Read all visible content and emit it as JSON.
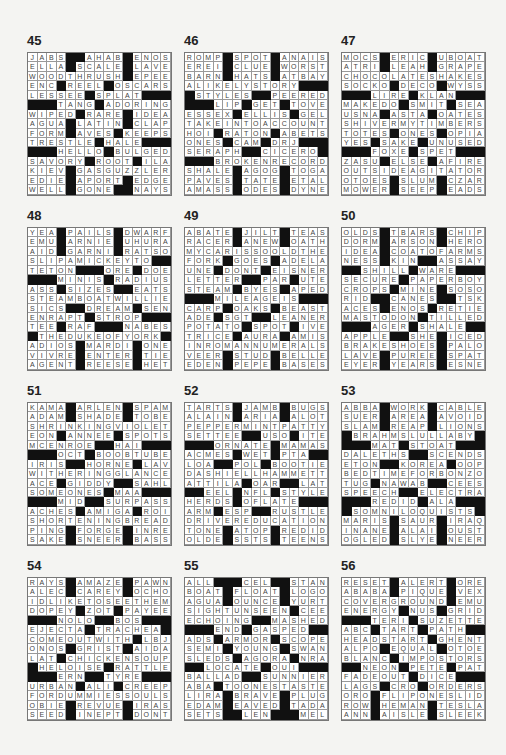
{
  "page": {
    "puzzles": [
      {
        "number": "45",
        "rows": [
          "JABS##AHAB#ENOS",
          "ELLA#SCALE#LAVE",
          "WOODTHRUSH#EPEE",
          "ENC#REEL#OSCARS",
          "LESSEE#SPLAT###",
          "###TANG#ADORING",
          "WIPED#RARE#IDEA",
          "AGUA#LATIN#CLAP",
          "FORM#AVES#KEEPS",
          "TRESTLE#HALE###",
          "###HELLO#BULGED",
          "SAVORY#ROOT#ILA",
          "KIEV#GASGUZZLER",
          "EDIE#APORT#EDGE",
          "WELL#GONE##NAYS"
        ]
      },
      {
        "number": "46",
        "rows": [
          "ROMP#SPOT#ANAIS",
          "EREI#CLUE#WORST",
          "BARN#HATS#ATBAY",
          "ALIKELYSTORY###",
          "#STYLES##PEERED",
          "###LIP#GET#TOVE",
          "ESSEX#ELLIS#GEL",
          "TAKEINTOACCOUNT",
          "HOI#RATON#ABETS",
          "ONES#CAM#DRJ###",
          "SERAPH##CICERO#",
          "###BROKENRECORD",
          "SHALE#AGOG#TOGA",
          "PAVES#TATE#ETAL",
          "AMASS#ODES#DYNE"
        ]
      },
      {
        "number": "47",
        "rows": [
          "MOCS#ERIC#UBOAT",
          "ATRI#LEAH#GRAPE",
          "CHOCOLATESHAKES",
          "SOCKO#DECO#WYSS",
          "###LIRE#KLAN###",
          "MAKEDO#SMIT#SEA",
          "USNA#ASTA#OATES",
          "SHIVERMYTIMBERS",
          "TOTES#ONES#OPIA",
          "YES#SAKE#UNUSED",
          "###FOXE#SPET###",
          "ZASU#ELSE#AFIRE",
          "OUTSIDEAGITATOR",
          "OTOES#SLUM#CZAR",
          "MOWER#SEEP#EADS"
        ]
      },
      {
        "number": "48",
        "rows": [
          "YEA#PAILS#DWARF",
          "EMU#ARNIE#UHURA",
          "AID#GARNI#RATSO",
          "SLIPAMICKEYTO##",
          "TETON###ORE#DOE",
          "###MINIS#RADIUS",
          "ASS#SIZES##EATS",
          "STEAMBOATWILLIE",
          "SICS##DREAM#SEN",
          "ENRAPT#STROP###",
          "TEE#RAF###NABES",
          "#THEDUKEOFYORK#",
          "ADIOS#MARDI#ONE",
          "VIVRE#ENTER#TIE",
          "AGENT#REESE#HET"
        ]
      },
      {
        "number": "49",
        "rows": [
          "ABATE#JILT#TEAS",
          "RACER#ANEW#OATH",
          "MYCARISSOOLDTHE",
          "FORK#GOES#ADELA",
          "UNE#DONT#EISNER",
          "LETTER##PAR#UTE",
          "STEAM#BYES#APED",
          "###MILEAGEIS###",
          "CARP#OAKS#BEAST",
          "ADE#SGT##LEANER",
          "POTATO#SPOT#IVE",
          "TRICE#AURA#AMIS",
          "INROMANNUMERALS",
          "VEER#STUD#BELLE",
          "EDEN#PEPE#BASES"
        ]
      },
      {
        "number": "50",
        "rows": [
          "OLDS#TBARS#CHIP",
          "DORM#ARSON#HERO",
          "IDEA#COATOFARMS",
          "NESS#KIN##ASSAY",
          "##SHILL#WARE###",
          "SECURE#PAPERBOY",
          "CROPS#MINE#SOSO",
          "RID##CANES##TSK",
          "ACES#ENOS#RETIE",
          "MASTODON#TILLED",
          "###AGER#SHALE##",
          "APPLE##SHE#ICED",
          "BRAKESHOES#PALO",
          "LAVE#PUREE#SPAT",
          "EYER#YEARS#ESNE"
        ]
      },
      {
        "number": "51",
        "rows": [
          "KAMA#ARLEN#SPAM",
          "ADAM#SHADE#TOBE",
          "SHRINKINGVIOLET",
          "EON#ANNEE#SPOTS",
          "MCENROE##HAI###",
          "###OCT#BOOBTUBE",
          "IRIS##HORNE#LAV",
          "WITHERINGGLANCE",
          "ACE#GIDDY##SAHL",
          "SOMEONES#MAA###",
          "###MID##SURPASS",
          "ACHES#AMIGA#ROI",
          "SHORTENINGBREAD",
          "PING#FORGE#INRE",
          "SAKE#SNEER#BASS"
        ]
      },
      {
        "number": "52",
        "rows": [
          "TARTS#JAMB#BUGS",
          "ALAIN#ARIA#ALOT",
          "PEPPERMINTPATTY",
          "SETTEE##USO#ITE",
          "###ORNATE#MAMAS",
          "ACMES#WET#PTA##",
          "LOA##POL#BOOTIE",
          "DASHIELLHAMMETT",
          "ATTILA#OAR##LAT",
          "##EEL#NFL#STYLE",
          "HERDS#OFLATE###",
          "ARM#ESP##RUSTLE",
          "DRIVEREDUCATION",
          "TONE#ATOP#REDID",
          "OLDE#SSTS#TEENS"
        ]
      },
      {
        "number": "53",
        "rows": [
          "ABBA#WORK#CABLE",
          "SUER#AREA#AVOID",
          "SLAM#REAP#LIONS",
          "#BRAHMSLULLABY#",
          "###MAT#STOAT###",
          "DALETHS##SCENDS",
          "ETON##KOREA#OOP",
          "BEDTIMEFORBONZO",
          "TUG#NAWAB##CEES",
          "SPEECH##ELECTRA",
          "###REDID#ALA###",
          "#SOMNILOQUISTS#",
          "MARIS#SAUR#IRAQ",
          "INANE#ALAI#OUST",
          "OGLED#SLYE#NEER"
        ]
      },
      {
        "number": "54",
        "rows": [
          "RAYS#AMAZE#PAWN",
          "ALEC#CAREY#OCHO",
          "IDLIKETOSEETHEM",
          "DOPEY#ZOT#PAYEE",
          "###NOLO##BOS###",
          "EJECTA#TRACHEA#",
          "COMEOUTWITH#LBJ",
          "ONOS#GRIST#AIDA",
          "LAT#CHICKENSOUP",
          "#HELOISE#RATTLE",
          "###ERN##TYRE###",
          "URBAN#ALI#CREEP",
          "FORDUMMIESSOULS",
          "OBIE#REVUE#IRAS",
          "SEED#INEPT#DONT"
        ]
      },
      {
        "number": "55",
        "rows": [
          "ALL###CEL##STAN",
          "BOAT#FLOAT#LOGO",
          "AGUA#OUNCE#YURT",
          "SIGHTUNSEEN#CEE",
          "ECHOING##MASHED",
          "###END#GASPED##",
          "ADS#ARMOR#SCOPE",
          "SEMI#YOUNG#SWAN",
          "SLEDS#AGORA#NRA",
          "##LOCATE#OUI###",
          "BALLAD##SUNNIER",
          "ABA#TOONESTASTE",
          "LIRA#BRAVE#PLUG",
          "EDAM#EAVED#TADA",
          "SETS##LEN###MEL"
        ]
      },
      {
        "number": "56",
        "rows": [
          "RESET#ALERT#ORE",
          "ABABA#PIQUE#VEX",
          "COVERGROUND#EMU",
          "ENERGY#NUS#GRID",
          "###TERI#SUZETTE",
          "ABC#TART#PATH##",
          "HEADSTART#GHENT",
          "ALPO#EQUAL#OTOE",
          "BLANC#IMPOSTORS",
          "##NEON#PETE#PAT",
          "FADEOUT#DICE###",
          "LAGS#CRO#ORDERS",
          "ORO#FLIPONESLID",
          "ROW#HEMAN#TESLA",
          "ANN#AISLE#SLEEK"
        ]
      }
    ]
  }
}
